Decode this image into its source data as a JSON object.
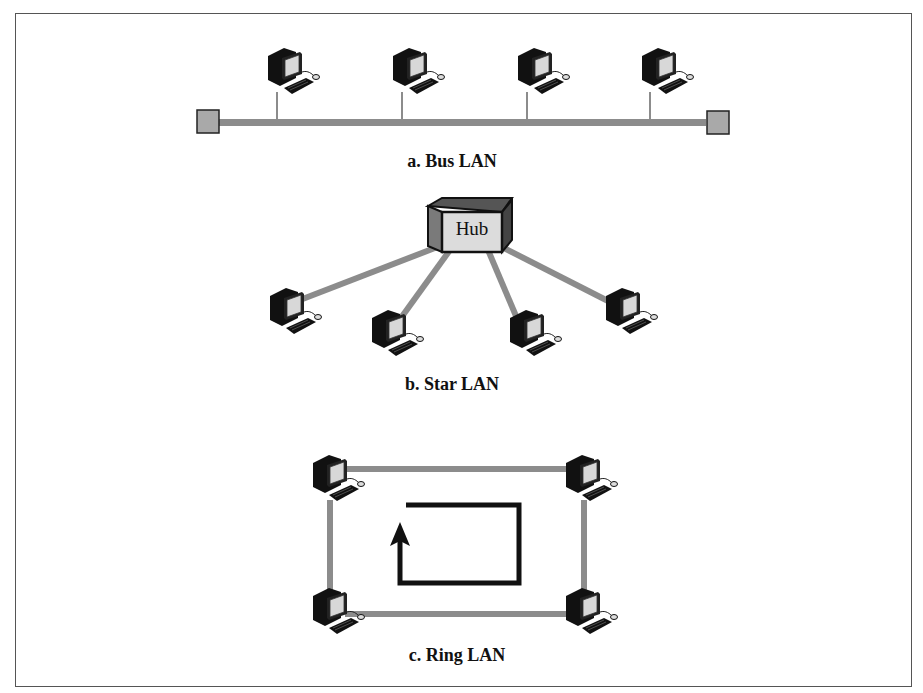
{
  "figure": {
    "panels": [
      {
        "id": "bus",
        "caption": "a. Bus LAN",
        "nodes": 4,
        "terminators": 2
      },
      {
        "id": "star",
        "caption": "b. Star LAN",
        "hub_label": "Hub",
        "nodes": 4
      },
      {
        "id": "ring",
        "caption": "c. Ring LAN",
        "nodes": 4,
        "direction": "counter-clockwise arrow"
      }
    ],
    "colors": {
      "link": "#8c8c8c",
      "terminator": "#a9a9a9",
      "hub_front": "#dcdcdc",
      "hub_side": "#808080",
      "arrow": "#111111",
      "border": "#555555"
    }
  }
}
